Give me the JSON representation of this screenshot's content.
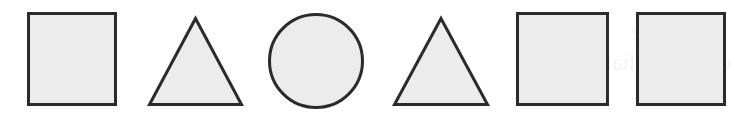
{
  "figure": {
    "width": 735,
    "height": 125,
    "background_color": "#ffffff"
  },
  "style": {
    "fill_color": "#ececec",
    "stroke_color": "#2b2b2b",
    "stroke_width": 3
  },
  "shapes": [
    {
      "index": 1,
      "name": "square",
      "label": "Square",
      "x": 27,
      "y": 12,
      "width": 90,
      "height": 94
    },
    {
      "index": 2,
      "name": "triangle",
      "label": "Triangle",
      "x": 148,
      "y": 17,
      "width": 95,
      "height": 89
    },
    {
      "index": 3,
      "name": "circle",
      "label": "Circle",
      "x": 268,
      "y": 13,
      "width": 96,
      "height": 96
    },
    {
      "index": 4,
      "name": "triangle",
      "label": "Triangle",
      "x": 393,
      "y": 17,
      "width": 96,
      "height": 89
    },
    {
      "index": 5,
      "name": "square",
      "label": "Square",
      "x": 516,
      "y": 12,
      "width": 93,
      "height": 94
    },
    {
      "index": 6,
      "name": "square",
      "label": "Square",
      "x": 636,
      "y": 12,
      "width": 90,
      "height": 94
    }
  ],
  "bleed_through": {
    "line_1": "ned value",
    "line_2": "orm and charge",
    "line_3": "e ba"
  }
}
